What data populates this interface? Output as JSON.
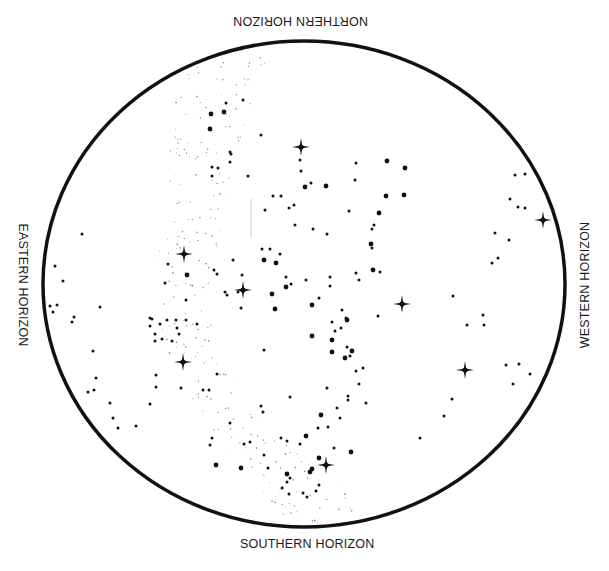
{
  "labels": {
    "north": "NORTHERN HORIZON",
    "south": "SOUTHERN HORIZON",
    "east": "EASTERN HORIZON",
    "west": "WESTERN HORIZON"
  },
  "colors": {
    "ink": "#111111",
    "milky_way": "#8a8a8a",
    "background": "#ffffff"
  },
  "horizon_ellipse": {
    "cx": 304,
    "cy": 284,
    "rx": 261,
    "ry": 243,
    "stroke_width": 3.5
  },
  "bright_stars": [
    [
      301,
      147
    ],
    [
      184,
      254
    ],
    [
      243,
      290
    ],
    [
      183,
      362
    ],
    [
      402,
      304
    ],
    [
      465,
      370
    ],
    [
      543,
      220
    ],
    [
      326,
      465
    ]
  ],
  "stars_large": [
    [
      211,
      114
    ],
    [
      224,
      112
    ],
    [
      210,
      129
    ],
    [
      387,
      161
    ],
    [
      405,
      168
    ],
    [
      305,
      187
    ],
    [
      326,
      186
    ],
    [
      386,
      196
    ],
    [
      404,
      195
    ],
    [
      379,
      213
    ],
    [
      371,
      244
    ],
    [
      264,
      260
    ],
    [
      276,
      263
    ],
    [
      187,
      275
    ],
    [
      373,
      270
    ],
    [
      286,
      287
    ],
    [
      272,
      294
    ],
    [
      275,
      309
    ],
    [
      312,
      305
    ],
    [
      347,
      320
    ],
    [
      312,
      336
    ],
    [
      332,
      340
    ],
    [
      332,
      352
    ],
    [
      345,
      358
    ],
    [
      352,
      351
    ],
    [
      306,
      436
    ],
    [
      287,
      474
    ],
    [
      319,
      458
    ],
    [
      312,
      469
    ],
    [
      310,
      472
    ],
    [
      216,
      465
    ],
    [
      241,
      468
    ],
    [
      321,
      415
    ],
    [
      351,
      452
    ]
  ],
  "stars_small": [
    [
      226,
      103
    ],
    [
      243,
      100
    ],
    [
      261,
      135
    ],
    [
      231,
      154
    ],
    [
      300,
      160
    ],
    [
      301,
      171
    ],
    [
      356,
      163
    ],
    [
      355,
      180
    ],
    [
      281,
      196
    ],
    [
      273,
      196
    ],
    [
      311,
      183
    ],
    [
      265,
      210
    ],
    [
      294,
      205
    ],
    [
      289,
      208
    ],
    [
      349,
      211
    ],
    [
      374,
      225
    ],
    [
      372,
      229
    ],
    [
      295,
      225
    ],
    [
      313,
      229
    ],
    [
      327,
      234
    ],
    [
      270,
      249
    ],
    [
      280,
      254
    ],
    [
      212,
      176
    ],
    [
      218,
      168
    ],
    [
      212,
      167
    ],
    [
      230,
      162
    ],
    [
      248,
      176
    ],
    [
      230,
      152
    ],
    [
      372,
      248
    ],
    [
      356,
      273
    ],
    [
      380,
      272
    ],
    [
      378,
      316
    ],
    [
      359,
      280
    ],
    [
      330,
      286
    ],
    [
      330,
      277
    ],
    [
      342,
      310
    ],
    [
      346,
      318
    ],
    [
      332,
      322
    ],
    [
      341,
      328
    ],
    [
      335,
      331
    ],
    [
      347,
      347
    ],
    [
      350,
      356
    ],
    [
      356,
      371
    ],
    [
      363,
      368
    ],
    [
      359,
      384
    ],
    [
      348,
      396
    ],
    [
      327,
      388
    ],
    [
      337,
      408
    ],
    [
      328,
      427
    ],
    [
      318,
      428
    ],
    [
      290,
      397
    ],
    [
      348,
      400
    ],
    [
      366,
      403
    ],
    [
      340,
      418
    ],
    [
      261,
      406
    ],
    [
      263,
      412
    ],
    [
      217,
      374
    ],
    [
      203,
      390
    ],
    [
      209,
      390
    ],
    [
      181,
      388
    ],
    [
      156,
      387
    ],
    [
      113,
      418
    ],
    [
      118,
      428
    ],
    [
      150,
      404
    ],
    [
      136,
      426
    ],
    [
      230,
      423
    ],
    [
      281,
      438
    ],
    [
      287,
      441
    ],
    [
      264,
      455
    ],
    [
      268,
      468
    ],
    [
      300,
      444
    ],
    [
      334,
      448
    ],
    [
      319,
      485
    ],
    [
      316,
      491
    ],
    [
      289,
      494
    ],
    [
      282,
      488
    ],
    [
      287,
      482
    ],
    [
      290,
      478
    ],
    [
      303,
      493
    ],
    [
      307,
      497
    ],
    [
      250,
      442
    ],
    [
      244,
      444
    ],
    [
      212,
      438
    ],
    [
      210,
      445
    ],
    [
      82,
      234
    ],
    [
      55,
      266
    ],
    [
      63,
      281
    ],
    [
      74,
      317
    ],
    [
      50,
      306
    ],
    [
      57,
      305
    ],
    [
      53,
      312
    ],
    [
      100,
      307
    ],
    [
      72,
      322
    ],
    [
      155,
      341
    ],
    [
      160,
      324
    ],
    [
      150,
      318
    ],
    [
      150,
      326
    ],
    [
      155,
      334
    ],
    [
      93,
      351
    ],
    [
      156,
      375
    ],
    [
      96,
      378
    ],
    [
      88,
      392
    ],
    [
      94,
      390
    ],
    [
      110,
      403
    ],
    [
      179,
      334
    ],
    [
      162,
      339
    ],
    [
      152,
      319
    ],
    [
      177,
      328
    ],
    [
      186,
      320
    ],
    [
      197,
      324
    ],
    [
      241,
      308
    ],
    [
      227,
      295
    ],
    [
      238,
      292
    ],
    [
      242,
      275
    ],
    [
      262,
      249
    ],
    [
      286,
      277
    ],
    [
      291,
      284
    ],
    [
      306,
      280
    ],
    [
      264,
      350
    ],
    [
      319,
      298
    ],
    [
      453,
      296
    ],
    [
      467,
      325
    ],
    [
      483,
      315
    ],
    [
      484,
      325
    ],
    [
      452,
      399
    ],
    [
      444,
      416
    ],
    [
      420,
      438
    ],
    [
      495,
      233
    ],
    [
      498,
      258
    ],
    [
      492,
      263
    ],
    [
      509,
      240
    ],
    [
      515,
      175
    ],
    [
      525,
      174
    ],
    [
      510,
      199
    ],
    [
      518,
      207
    ],
    [
      525,
      208
    ],
    [
      506,
      365
    ],
    [
      519,
      364
    ],
    [
      530,
      374
    ],
    [
      513,
      384
    ],
    [
      168,
      264
    ],
    [
      165,
      283
    ],
    [
      167,
      320
    ],
    [
      172,
      341
    ],
    [
      176,
      320
    ],
    [
      186,
      300
    ],
    [
      233,
      260
    ],
    [
      225,
      292
    ],
    [
      214,
      270
    ],
    [
      217,
      274
    ]
  ],
  "milky_way_band": {
    "path": "M 182 63 C 210 50 250 45 270 48 C 260 80 245 110 240 150 C 232 195 215 240 210 300 C 212 350 235 400 280 440 C 320 470 350 490 365 520 C 335 527 310 528 285 526 C 270 500 255 480 235 455 C 205 420 175 390 165 345 C 155 300 158 240 165 200 C 172 150 170 100 182 63 Z"
  }
}
